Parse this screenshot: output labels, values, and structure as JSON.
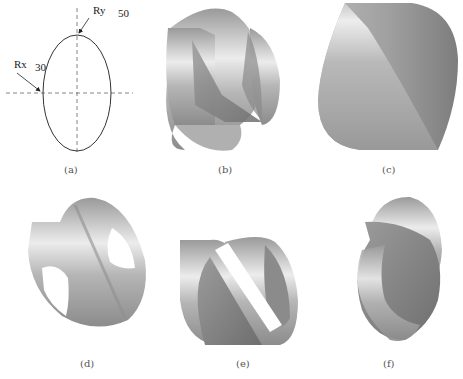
{
  "figure": {
    "panels": [
      {
        "id": "a",
        "label": "(a)",
        "kind": "ellipse-parameter-sketch"
      },
      {
        "id": "b",
        "label": "(b)",
        "kind": "intersecting-elliptic-cylinders-render"
      },
      {
        "id": "c",
        "label": "(c)",
        "kind": "solid-intersection-render"
      },
      {
        "id": "d",
        "label": "(d)",
        "kind": "cylinder-shell-with-holes-render"
      },
      {
        "id": "e",
        "label": "(e)",
        "kind": "sectioned-cylinders-render"
      },
      {
        "id": "f",
        "label": "(f)",
        "kind": "twisted-shell-render"
      }
    ],
    "ellipse": {
      "rx_label": "Rx",
      "rx_value": "30",
      "ry_label": "Ry",
      "ry_value": "50"
    },
    "colors": {
      "shade_light": "#e6e6e6",
      "shade_mid": "#a8a8a8",
      "shade_dark": "#7a7a7a",
      "line": "#333333",
      "dash": "#666666"
    }
  }
}
